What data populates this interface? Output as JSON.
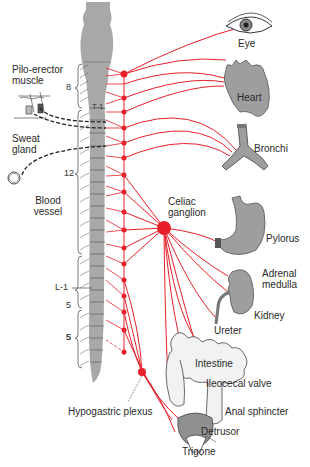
{
  "diagram": {
    "nerve_color": "#e8202a",
    "cord_color": "#a8a8a8",
    "organ_color": "#9e9e9e",
    "spinal_levels": {
      "cervical": "8",
      "t1": "T-1",
      "thoracic": "12",
      "l1": "L-1",
      "lumbar": "5",
      "sacral": "5"
    },
    "left_labels": {
      "pilo_erector": "Pilo-erector muscle",
      "sweat_gland": "Sweat gland",
      "blood_vessel": "Blood vessel",
      "hypogastric": "Hypogastric plexus"
    },
    "ganglion_label": "Celiac ganglion",
    "organs": [
      {
        "label": "Eye"
      },
      {
        "label": "Heart"
      },
      {
        "label": "Bronchi"
      },
      {
        "label": "Pylorus"
      },
      {
        "label": "Adrenal medulla"
      },
      {
        "label": "Kidney"
      },
      {
        "label": "Ureter"
      },
      {
        "label": "Intestine"
      },
      {
        "label": "Ileocecal valve"
      },
      {
        "label": "Anal sphincter"
      },
      {
        "label": "Detrusor"
      },
      {
        "label": "Trigone"
      }
    ]
  }
}
